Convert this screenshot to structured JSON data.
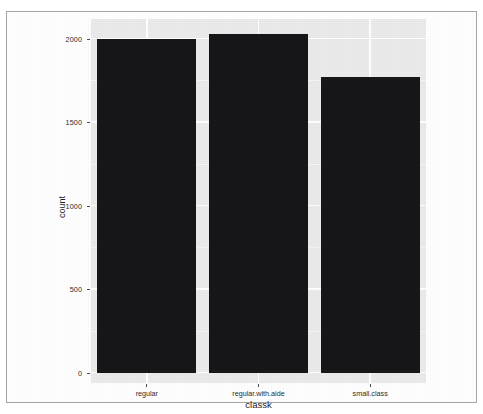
{
  "chart_data": {
    "type": "bar",
    "title": "",
    "subtitle": "",
    "xlabel": "classk",
    "ylabel": "count",
    "categories": [
      "regular",
      "regular.with.aide",
      "small.class"
    ],
    "values": [
      2000,
      2030,
      1773
    ],
    "series": [
      {
        "name": "count",
        "values": [
          2000,
          2030,
          1773
        ]
      }
    ],
    "ylim": [
      0,
      2080
    ],
    "y_ticks": [
      0,
      500,
      1000,
      1500,
      2000
    ],
    "y_tick_labels": [
      "0",
      "500",
      "1000",
      "1500",
      "2000"
    ],
    "x_tick_labels": [
      "regular",
      "regular.with.aide",
      "small.class"
    ],
    "grid": true,
    "legend": null,
    "legend_position": "none",
    "annotations": [],
    "colors": {
      "bar_fill": "#17171a",
      "panel_background": "#ebebeb",
      "gridline_major": "#ffffff",
      "gridline_minor": "#f5f5f5",
      "figure_background": "#ffffff",
      "frame_border": "#a6a6a6",
      "axis_text": "#2b2b2b",
      "axis_title": "#1a1a1a"
    }
  },
  "figure": {
    "y_axis": {
      "title": "count",
      "ticks": [
        {
          "label": "2000",
          "value": 2000
        },
        {
          "label": "1500",
          "value": 1500
        },
        {
          "label": "1000",
          "value": 1000
        },
        {
          "label": "500",
          "value": 500
        },
        {
          "label": "0",
          "value": 0
        }
      ]
    },
    "x_axis": {
      "title": "classk",
      "ticks": [
        {
          "label": "regular"
        },
        {
          "label": "regular.with.aide"
        },
        {
          "label": "small.class"
        }
      ]
    },
    "bars": [
      {
        "category": "regular",
        "count": 2000
      },
      {
        "category": "regular.with.aide",
        "count": 2030
      },
      {
        "category": "small.class",
        "count": 1773
      }
    ]
  }
}
